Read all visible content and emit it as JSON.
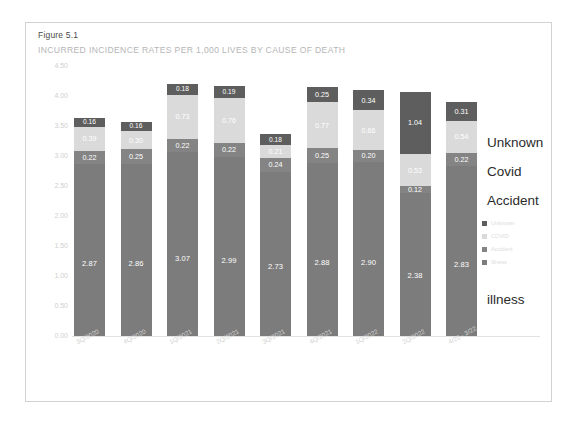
{
  "figure": {
    "title": "Figure 5.1",
    "subtitle": "INCURRED INCIDENCE RATES PER 1,000 LIVES BY CAUSE OF DEATH"
  },
  "legend": {
    "items": [
      {
        "label": "Unknown",
        "color": "#5e5e5e"
      },
      {
        "label": "COVID",
        "color": "#dadada"
      },
      {
        "label": "Accident",
        "color": "#848484"
      },
      {
        "label": "Illness",
        "color": "#7c7c7c"
      }
    ]
  },
  "callouts": {
    "unknown": "Unknown",
    "covid": "Covid",
    "accident": "Accident",
    "illness": "illness"
  },
  "chart_data": {
    "type": "bar",
    "stacked": true,
    "title": "Figure 5.1",
    "subtitle": "INCURRED INCIDENCE RATES PER 1,000 LIVES BY CAUSE OF DEATH",
    "xlabel": "",
    "ylabel": "",
    "ylim": [
      0.0,
      4.5
    ],
    "ytick_labels": [
      "4.50",
      "4.00",
      "3.50",
      "3.00",
      "2.50",
      "2.00",
      "1.50",
      "1.00",
      "0.50",
      "0.00"
    ],
    "ytick_values": [
      4.5,
      4.0,
      3.5,
      3.0,
      2.5,
      2.0,
      1.5,
      1.0,
      0.5,
      0.0
    ],
    "grid": false,
    "legend_position": "right",
    "categories": [
      "3Q/2020",
      "4Q/2020",
      "1Q/2021",
      "2Q/2021",
      "3Q/2021",
      "4Q/2021",
      "1Q/2022",
      "2Q/2022",
      "4/20 - 3/22"
    ],
    "series": [
      {
        "name": "Illness",
        "color": "#7c7c7c",
        "values": [
          2.87,
          2.86,
          3.07,
          2.99,
          2.73,
          2.88,
          2.9,
          2.38,
          2.83
        ]
      },
      {
        "name": "Accident",
        "color": "#848484",
        "values": [
          0.22,
          0.25,
          0.22,
          0.22,
          0.24,
          0.25,
          0.2,
          0.12,
          0.22
        ]
      },
      {
        "name": "COVID",
        "color": "#dadada",
        "values": [
          0.39,
          0.3,
          0.73,
          0.76,
          0.21,
          0.77,
          0.66,
          0.53,
          0.54
        ]
      },
      {
        "name": "Unknown",
        "color": "#5e5e5e",
        "values": [
          0.16,
          0.16,
          0.18,
          0.19,
          0.18,
          0.25,
          0.34,
          1.04,
          0.31
        ]
      }
    ],
    "bar_labels": {
      "illness": [
        "2.87",
        "2.86",
        "3.07",
        "2.99",
        "2.73",
        "2.88",
        "2.90",
        "2.38",
        "2.83"
      ],
      "accident": [
        "0.22",
        "0.25",
        "0.22",
        "0.22",
        "0.24",
        "0.25",
        "0.20",
        "0.12",
        "0.22"
      ],
      "covid": [
        "0.39",
        "0.30",
        "0.73",
        "0.76",
        "0.21",
        "0.77",
        "0.66",
        "0.53",
        "0.54"
      ],
      "unknown": [
        "0.16",
        "0.16",
        "0.18",
        "0.19",
        "0.18",
        "0.25",
        "0.34",
        "1.04",
        "0.31"
      ]
    }
  }
}
